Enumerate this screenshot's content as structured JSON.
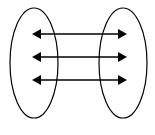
{
  "diagram": {
    "stroke_color": "#000000",
    "background": "#ffffff",
    "sets": [
      {
        "name": "left-set",
        "cx": 34,
        "cy": 63,
        "rx": 24,
        "ry": 55
      },
      {
        "name": "right-set",
        "cx": 123,
        "cy": 63,
        "rx": 24,
        "ry": 55
      }
    ],
    "arrows": [
      {
        "x1": 32,
        "x2": 127,
        "y": 34,
        "type": "double-headed"
      },
      {
        "x1": 32,
        "x2": 127,
        "y": 57,
        "type": "double-headed"
      },
      {
        "x1": 32,
        "x2": 127,
        "y": 80,
        "type": "double-headed"
      }
    ]
  }
}
